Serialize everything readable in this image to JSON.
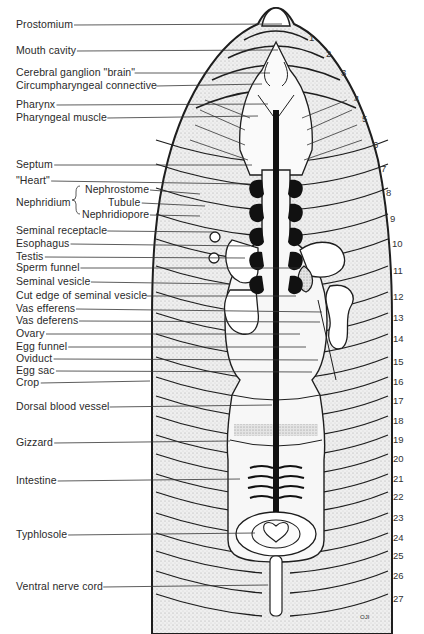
{
  "diagram": {
    "labels": [
      {
        "id": "prostomium",
        "text": "Prostomium",
        "x": 16,
        "y": 18,
        "lineTo": [
          282,
          24
        ]
      },
      {
        "id": "mouth-cavity",
        "text": "Mouth cavity",
        "x": 16,
        "y": 44,
        "lineTo": [
          278,
          50
        ]
      },
      {
        "id": "cerebral-ganglion",
        "text": "Cerebral ganglion \"brain\"",
        "x": 16,
        "y": 66,
        "lineTo": [
          270,
          73
        ]
      },
      {
        "id": "circumpharyngeal-connective",
        "text": "Circumpharyngeal connective",
        "x": 16,
        "y": 79,
        "lineTo": [
          262,
          84
        ]
      },
      {
        "id": "pharynx",
        "text": "Pharynx",
        "x": 16,
        "y": 98,
        "lineTo": [
          268,
          104
        ]
      },
      {
        "id": "pharyngeal-muscle",
        "text": "Pharyngeal muscle",
        "x": 16,
        "y": 111,
        "lineTo": [
          258,
          116
        ]
      },
      {
        "id": "septum",
        "text": "Septum",
        "x": 16,
        "y": 158,
        "lineTo": [
          252,
          165
        ]
      },
      {
        "id": "heart",
        "text": "\"Heart\"",
        "x": 16,
        "y": 174,
        "lineTo": [
          250,
          184
        ]
      },
      {
        "id": "nephrostome",
        "text": "Nephrostome",
        "x": 85,
        "y": 183,
        "lineTo": [
          200,
          194
        ]
      },
      {
        "id": "tubule",
        "text": "Tubule",
        "x": 108,
        "y": 196,
        "lineTo": [
          205,
          206
        ]
      },
      {
        "id": "nephridiopore",
        "text": "Nephridiopore",
        "x": 82,
        "y": 208,
        "lineTo": [
          200,
          216
        ]
      },
      {
        "id": "seminal-receptacle",
        "text": "Seminal receptacle",
        "x": 16,
        "y": 224,
        "lineTo": [
          214,
          232
        ]
      },
      {
        "id": "esophagus",
        "text": "Esophagus",
        "x": 16,
        "y": 237,
        "lineTo": [
          250,
          246
        ]
      },
      {
        "id": "testis",
        "text": "Testis",
        "x": 16,
        "y": 250,
        "lineTo": [
          245,
          258
        ]
      },
      {
        "id": "sperm-funnel",
        "text": "Sperm funnel",
        "x": 16,
        "y": 261,
        "lineTo": [
          300,
          268
        ]
      },
      {
        "id": "seminal-vesicle",
        "text": "Seminal vesicle",
        "x": 16,
        "y": 275,
        "lineTo": [
          230,
          284
        ]
      },
      {
        "id": "cut-edge-seminal-vesicle",
        "text": "Cut edge of seminal vesicle",
        "x": 16,
        "y": 289,
        "lineTo": [
          296,
          296
        ]
      },
      {
        "id": "vas-efferens",
        "text": "Vas efferens",
        "x": 16,
        "y": 302,
        "lineTo": [
          322,
          312
        ]
      },
      {
        "id": "vas-deferens",
        "text": "Vas deferens",
        "x": 16,
        "y": 314,
        "lineTo": [
          320,
          322
        ]
      },
      {
        "id": "ovary",
        "text": "Ovary",
        "x": 16,
        "y": 327,
        "lineTo": [
          300,
          334
        ]
      },
      {
        "id": "egg-funnel",
        "text": "Egg funnel",
        "x": 16,
        "y": 340,
        "lineTo": [
          306,
          347
        ]
      },
      {
        "id": "oviduct",
        "text": "Oviduct",
        "x": 16,
        "y": 352,
        "lineTo": [
          318,
          360
        ]
      },
      {
        "id": "egg-sac",
        "text": "Egg sac",
        "x": 16,
        "y": 364,
        "lineTo": [
          312,
          372
        ]
      },
      {
        "id": "crop",
        "text": "Crop",
        "x": 16,
        "y": 376,
        "lineTo": [
          150,
          381
        ]
      },
      {
        "id": "dorsal-blood-vessel",
        "text": "Dorsal blood vessel",
        "x": 16,
        "y": 400,
        "lineTo": [
          272,
          405
        ]
      },
      {
        "id": "gizzard",
        "text": "Gizzard",
        "x": 16,
        "y": 436,
        "lineTo": [
          230,
          441
        ]
      },
      {
        "id": "intestine",
        "text": "Intestine",
        "x": 16,
        "y": 474,
        "lineTo": [
          240,
          479
        ]
      },
      {
        "id": "typhlosole",
        "text": "Typhlosole",
        "x": 16,
        "y": 528,
        "lineTo": [
          255,
          533
        ]
      },
      {
        "id": "ventral-nerve-cord",
        "text": "Ventral nerve cord",
        "x": 16,
        "y": 580,
        "lineTo": [
          268,
          585
        ]
      }
    ],
    "nephridium_group": {
      "text": "Nephridium",
      "x": 16,
      "y": 196
    },
    "segment_numbers": [
      {
        "n": "1",
        "x": 309,
        "y": 33
      },
      {
        "n": "2",
        "x": 326,
        "y": 49
      },
      {
        "n": "3",
        "x": 341,
        "y": 68
      },
      {
        "n": "4",
        "x": 354,
        "y": 94
      },
      {
        "n": "5",
        "x": 362,
        "y": 114
      },
      {
        "n": "6",
        "x": 373,
        "y": 140
      },
      {
        "n": "7",
        "x": 381,
        "y": 164
      },
      {
        "n": "8",
        "x": 386,
        "y": 188
      },
      {
        "n": "9",
        "x": 390,
        "y": 214
      },
      {
        "n": "10",
        "x": 392,
        "y": 239
      },
      {
        "n": "11",
        "x": 393,
        "y": 266
      },
      {
        "n": "12",
        "x": 393,
        "y": 292
      },
      {
        "n": "13",
        "x": 393,
        "y": 313
      },
      {
        "n": "14",
        "x": 393,
        "y": 334
      },
      {
        "n": "15",
        "x": 393,
        "y": 357
      },
      {
        "n": "16",
        "x": 393,
        "y": 377
      },
      {
        "n": "17",
        "x": 393,
        "y": 396
      },
      {
        "n": "18",
        "x": 393,
        "y": 416
      },
      {
        "n": "19",
        "x": 393,
        "y": 435
      },
      {
        "n": "20",
        "x": 393,
        "y": 454
      },
      {
        "n": "21",
        "x": 393,
        "y": 474
      },
      {
        "n": "22",
        "x": 393,
        "y": 492
      },
      {
        "n": "23",
        "x": 393,
        "y": 513
      },
      {
        "n": "24",
        "x": 393,
        "y": 533
      },
      {
        "n": "25",
        "x": 393,
        "y": 551
      },
      {
        "n": "26",
        "x": 393,
        "y": 571
      },
      {
        "n": "27",
        "x": 393,
        "y": 594
      }
    ],
    "signature": "OJI",
    "colors": {
      "ink": "#1e1e1e",
      "stipple": "#d9d9d9",
      "background": "#ffffff"
    }
  }
}
